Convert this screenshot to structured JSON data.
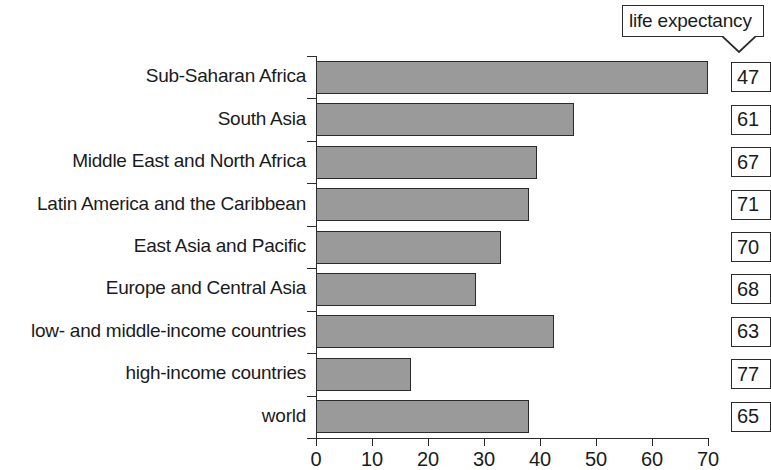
{
  "callout": {
    "label": "life expectancy"
  },
  "chart_data": {
    "type": "bar",
    "orientation": "horizontal",
    "title": "",
    "xlabel": "",
    "ylabel": "",
    "xlim": [
      0,
      70
    ],
    "xticks": [
      0,
      10,
      20,
      30,
      40,
      50,
      60,
      70
    ],
    "xtick_labels": [
      "0",
      "10",
      "20",
      "30",
      "40",
      "50",
      "60",
      "70"
    ],
    "grid": false,
    "legend": null,
    "bar_color": "#9a9a9a",
    "bar_edge_color": "#2b2b2b",
    "annotation_label": "life expectancy",
    "categories": [
      "Sub-Saharan Africa",
      "South Asia",
      "Middle East and North Africa",
      "Latin America and the Caribbean",
      "East Asia and Pacific",
      "Europe and Central Asia",
      "low- and middle-income countries",
      "high-income countries",
      "world"
    ],
    "values": [
      70,
      46,
      39.5,
      38,
      33,
      28.5,
      42.5,
      17,
      38
    ],
    "annotations": {
      "name": "life expectancy",
      "values": [
        47,
        61,
        67,
        71,
        70,
        68,
        63,
        77,
        65
      ]
    }
  }
}
